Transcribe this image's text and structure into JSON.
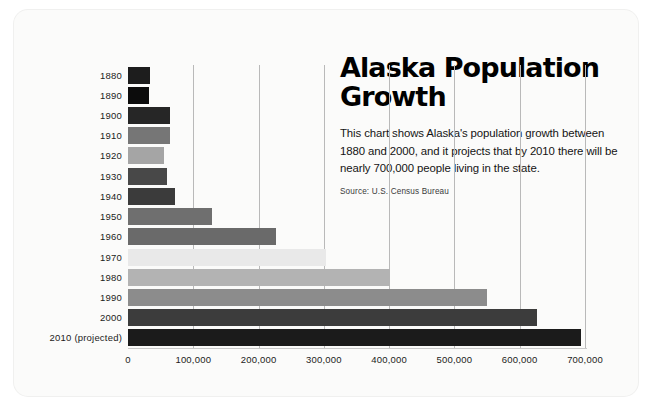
{
  "headline": {
    "title": "Alaska Population Growth",
    "description": "This chart shows Alaska's population growth between 1880 and 2000, and it projects that by 2010 there will be nearly 700,000 people living in the state.",
    "source": "Source: U.S. Census Bureau"
  },
  "chart_data": {
    "type": "bar",
    "orientation": "horizontal",
    "title": "Alaska Population Growth",
    "xlabel": "",
    "ylabel": "",
    "xlim": [
      0,
      700000
    ],
    "xticks": [
      0,
      100000,
      200000,
      300000,
      400000,
      500000,
      600000,
      700000
    ],
    "xticklabels": [
      "0",
      "100,000",
      "200,000",
      "300,000",
      "400,000",
      "500,000",
      "600,000",
      "700,000"
    ],
    "grid": "vertical",
    "legend": "none",
    "categories": [
      "1880",
      "1890",
      "1900",
      "1910",
      "1920",
      "1930",
      "1940",
      "1950",
      "1960",
      "1970",
      "1980",
      "1990",
      "2000",
      "2010 (projected)"
    ],
    "values": [
      33426,
      32052,
      63592,
      64356,
      55036,
      59278,
      72524,
      128643,
      226167,
      302583,
      401851,
      550043,
      626932,
      694109
    ],
    "colors": [
      "#1d1d1d",
      "#0c0c0c",
      "#262626",
      "#767676",
      "#a5a5a5",
      "#484848",
      "#3b3b3b",
      "#6f6f6f",
      "#6a6a6a",
      "#e9e9e9",
      "#b3b3b3",
      "#8c8c8c",
      "#3c3c3c",
      "#1b1b1b"
    ],
    "gridline_color": "#b9b9b9",
    "background": "#fbfbfa"
  }
}
